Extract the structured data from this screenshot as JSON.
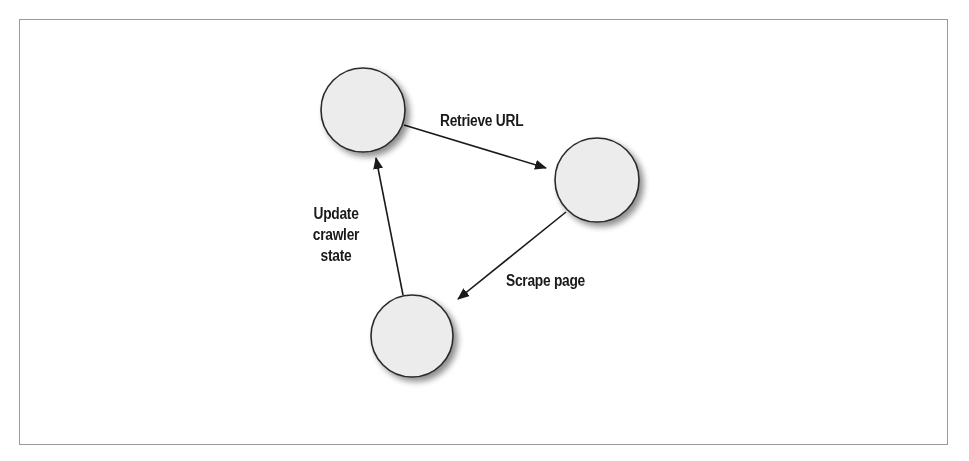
{
  "diagram": {
    "nodes": [
      {
        "id": "n1",
        "cx": 363,
        "cy": 110,
        "r": 42,
        "label": ""
      },
      {
        "id": "n2",
        "cx": 597,
        "cy": 180,
        "r": 42,
        "label": ""
      },
      {
        "id": "n3",
        "cx": 412,
        "cy": 336,
        "r": 41,
        "label": ""
      }
    ],
    "edges": [
      {
        "from": "n1",
        "to": "n2",
        "label": "Retrieve URL"
      },
      {
        "from": "n2",
        "to": "n3",
        "label": "Scrape page"
      },
      {
        "from": "n3",
        "to": "n1",
        "label_lines": [
          "Update",
          "crawler",
          "state"
        ]
      }
    ],
    "colors": {
      "node_fill": "#ececec",
      "node_stroke": "#2a2a2a",
      "edge": "#1a1a1a",
      "frame": "#9a9a9a"
    }
  }
}
